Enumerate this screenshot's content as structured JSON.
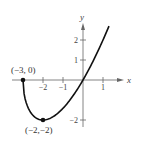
{
  "chart_data": {
    "type": "line",
    "title": "",
    "xlabel": "x",
    "ylabel": "y",
    "function": "y = x*sqrt(x+3)",
    "x_ticks": [
      -2,
      -1,
      1
    ],
    "x_tick_labels": [
      "−2",
      "−1",
      "1"
    ],
    "y_ticks": [
      2,
      1,
      -2
    ],
    "y_tick_labels": [
      "2",
      "1",
      "−2"
    ],
    "xlim": [
      -3.5,
      2
    ],
    "ylim": [
      -2.3,
      2.9
    ],
    "grid": false,
    "series": [
      {
        "name": "curve",
        "x": [
          -3,
          -2.9,
          -2.75,
          -2.5,
          -2.25,
          -2,
          -1.5,
          -1,
          -0.5,
          0,
          0.5,
          1,
          1.3
        ],
        "y": [
          0,
          -0.92,
          -1.38,
          -1.77,
          -1.95,
          -2,
          -1.84,
          -1.41,
          -0.79,
          0,
          0.94,
          2,
          2.7
        ]
      }
    ],
    "points": [
      {
        "x": -3,
        "y": 0,
        "label": "(−3, 0)"
      },
      {
        "x": -2,
        "y": -2,
        "label": "(−2,−2)"
      }
    ]
  }
}
